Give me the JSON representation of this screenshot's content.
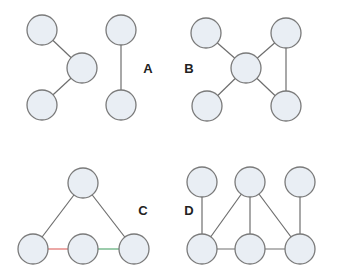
{
  "diagram": {
    "title": "",
    "node_radius": 15,
    "colors": {
      "node_fill": "#e9eef4",
      "node_stroke": "#7a7a7a",
      "edge_default": "#6e6e6e",
      "edge_red": "#d9534f",
      "edge_green": "#3a9a5b",
      "label": "#222222"
    },
    "graphs": [
      {
        "label": "A",
        "label_pos": [
          148,
          73
        ],
        "nodes": [
          [
            42,
            30
          ],
          [
            82,
            68
          ],
          [
            42,
            105
          ],
          [
            121,
            30
          ],
          [
            121,
            105
          ]
        ],
        "edges": [
          [
            0,
            1,
            "default"
          ],
          [
            1,
            2,
            "default"
          ],
          [
            3,
            4,
            "default"
          ]
        ]
      },
      {
        "label": "B",
        "label_pos": [
          189,
          73
        ],
        "nodes": [
          [
            206,
            33
          ],
          [
            246,
            68
          ],
          [
            286,
            33
          ],
          [
            207,
            106
          ],
          [
            286,
            106
          ]
        ],
        "edges": [
          [
            0,
            1,
            "default"
          ],
          [
            1,
            2,
            "default"
          ],
          [
            1,
            3,
            "default"
          ],
          [
            1,
            4,
            "default"
          ],
          [
            2,
            4,
            "default"
          ]
        ]
      },
      {
        "label": "C",
        "label_pos": [
          143,
          215
        ],
        "nodes": [
          [
            83,
            183
          ],
          [
            33,
            249
          ],
          [
            83,
            249
          ],
          [
            134,
            249
          ]
        ],
        "edges": [
          [
            0,
            1,
            "default"
          ],
          [
            0,
            3,
            "default"
          ],
          [
            1,
            2,
            "red"
          ],
          [
            2,
            3,
            "green"
          ]
        ]
      },
      {
        "label": "D",
        "label_pos": [
          189,
          215
        ],
        "nodes": [
          [
            202,
            182
          ],
          [
            250,
            182
          ],
          [
            300,
            182
          ],
          [
            202,
            249
          ],
          [
            250,
            249
          ],
          [
            300,
            249
          ]
        ],
        "edges": [
          [
            0,
            3,
            "default"
          ],
          [
            1,
            3,
            "default"
          ],
          [
            1,
            4,
            "default"
          ],
          [
            1,
            5,
            "default"
          ],
          [
            2,
            5,
            "default"
          ],
          [
            3,
            4,
            "default"
          ],
          [
            4,
            5,
            "default"
          ]
        ]
      }
    ]
  }
}
